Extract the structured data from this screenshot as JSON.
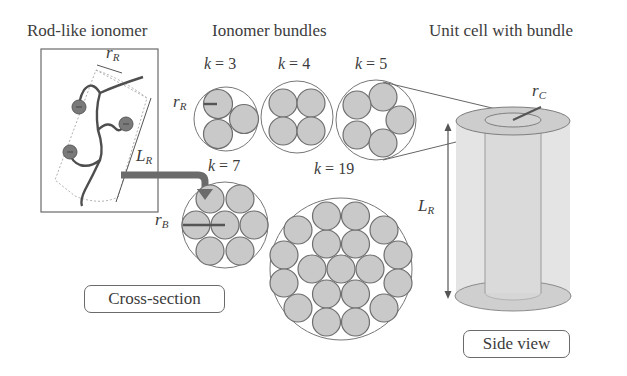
{
  "titles": {
    "rod": "Rod-like ionomer",
    "bundles": "Ionomer bundles",
    "unit_cell": "Unit cell with bundle"
  },
  "bundles": [
    {
      "k_label": "k",
      "eq": " = 3",
      "k": 3
    },
    {
      "k_label": "k",
      "eq": " = 4",
      "k": 4
    },
    {
      "k_label": "k",
      "eq": " = 5",
      "k": 5
    },
    {
      "k_label": "k",
      "eq": " = 7",
      "k": 7
    },
    {
      "k_label": "k",
      "eq": " = 19",
      "k": 19
    }
  ],
  "symbols": {
    "r_R_rod": {
      "base": "r",
      "sub": "R"
    },
    "L_R_rod": {
      "base": "L",
      "sub": "R"
    },
    "r_R_bundle": {
      "base": "r",
      "sub": "R"
    },
    "r_B": {
      "base": "r",
      "sub": "B"
    },
    "r_C": {
      "base": "r",
      "sub": "C"
    },
    "L_R_cell": {
      "base": "L",
      "sub": "R"
    }
  },
  "boxes": {
    "cross_section": "Cross-section",
    "side_view": "Side view"
  },
  "colors": {
    "circle_fill": "#c9c9c9",
    "circle_stroke": "#6e6e6e",
    "line": "#555555",
    "arrow": "#6b6b6b",
    "cylinder_fill": "#e3e3e3",
    "ellipse_fill": "#cdcdcd"
  }
}
